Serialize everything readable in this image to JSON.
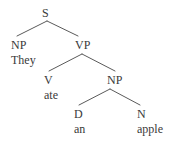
{
  "tree": {
    "nodes": [
      {
        "id": "s",
        "label": "S",
        "x": 42,
        "y": 7
      },
      {
        "id": "np1",
        "label": "NP",
        "x": 11,
        "y": 39
      },
      {
        "id": "vp",
        "label": "VP",
        "x": 75,
        "y": 39
      },
      {
        "id": "v",
        "label": "V",
        "x": 44,
        "y": 74
      },
      {
        "id": "np2",
        "label": "NP",
        "x": 107,
        "y": 74
      },
      {
        "id": "d",
        "label": "D",
        "x": 74,
        "y": 108
      },
      {
        "id": "n",
        "label": "N",
        "x": 137,
        "y": 108
      }
    ],
    "words": [
      {
        "parent": "np1",
        "text": "They",
        "x": 11,
        "y": 54
      },
      {
        "parent": "v",
        "text": "ate",
        "x": 44,
        "y": 89
      },
      {
        "parent": "d",
        "text": "an",
        "x": 74,
        "y": 123
      },
      {
        "parent": "n",
        "text": "apple",
        "x": 137,
        "y": 123
      }
    ],
    "edges": [
      {
        "from": "s",
        "to": "np1",
        "x1": 47,
        "y1": 21,
        "x2": 17,
        "y2": 36
      },
      {
        "from": "s",
        "to": "vp",
        "x1": 47,
        "y1": 21,
        "x2": 78,
        "y2": 36
      },
      {
        "from": "vp",
        "to": "v",
        "x1": 82,
        "y1": 54,
        "x2": 49,
        "y2": 71
      },
      {
        "from": "vp",
        "to": "np2",
        "x1": 82,
        "y1": 54,
        "x2": 115,
        "y2": 71
      },
      {
        "from": "np2",
        "to": "d",
        "x1": 110,
        "y1": 89,
        "x2": 79,
        "y2": 105
      },
      {
        "from": "np2",
        "to": "n",
        "x1": 110,
        "y1": 89,
        "x2": 140,
        "y2": 105
      }
    ]
  }
}
